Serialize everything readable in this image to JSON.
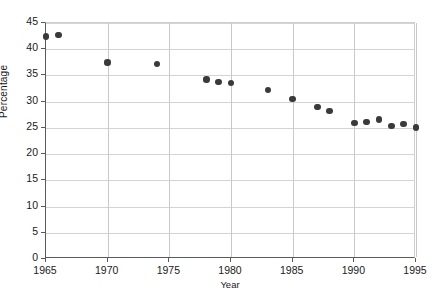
{
  "chart_data": {
    "type": "scatter",
    "title": "",
    "xlabel": "Year",
    "ylabel": "Percentage",
    "xlim": [
      1965,
      1995
    ],
    "ylim": [
      0,
      45
    ],
    "xticks": [
      1965,
      1970,
      1975,
      1980,
      1985,
      1990,
      1995
    ],
    "yticks": [
      0,
      5,
      10,
      15,
      20,
      25,
      30,
      35,
      40,
      45
    ],
    "xtick_labels": [
      "1965",
      "1970",
      "1975",
      "1980",
      "1985",
      "1990",
      "1995"
    ],
    "ytick_labels": [
      "0",
      "5",
      "10",
      "15",
      "20",
      "25",
      "30",
      "35",
      "40",
      "45"
    ],
    "grid": "both",
    "legend": "none",
    "marker": "filled-circle",
    "marker_color": "#3a3a3a",
    "x": [
      1965,
      1966,
      1970,
      1974,
      1978,
      1979,
      1980,
      1983,
      1985,
      1987,
      1988,
      1990,
      1991,
      1992,
      1993,
      1994,
      1995
    ],
    "y": [
      42.4,
      42.7,
      37.5,
      37.2,
      34.2,
      33.8,
      33.6,
      32.2,
      30.5,
      29.0,
      28.2,
      25.9,
      26.1,
      26.6,
      25.4,
      25.8,
      25.1
    ],
    "points": [
      {
        "x": 1965,
        "y": 42.4
      },
      {
        "x": 1966,
        "y": 42.7
      },
      {
        "x": 1970,
        "y": 37.5
      },
      {
        "x": 1974,
        "y": 37.2
      },
      {
        "x": 1978,
        "y": 34.2
      },
      {
        "x": 1979,
        "y": 33.8
      },
      {
        "x": 1980,
        "y": 33.6
      },
      {
        "x": 1983,
        "y": 32.2
      },
      {
        "x": 1985,
        "y": 30.5
      },
      {
        "x": 1987,
        "y": 29.0
      },
      {
        "x": 1988,
        "y": 28.2
      },
      {
        "x": 1990,
        "y": 25.9
      },
      {
        "x": 1991,
        "y": 26.1
      },
      {
        "x": 1992,
        "y": 26.6
      },
      {
        "x": 1993,
        "y": 25.4
      },
      {
        "x": 1994,
        "y": 25.8
      },
      {
        "x": 1995,
        "y": 25.1
      }
    ]
  }
}
